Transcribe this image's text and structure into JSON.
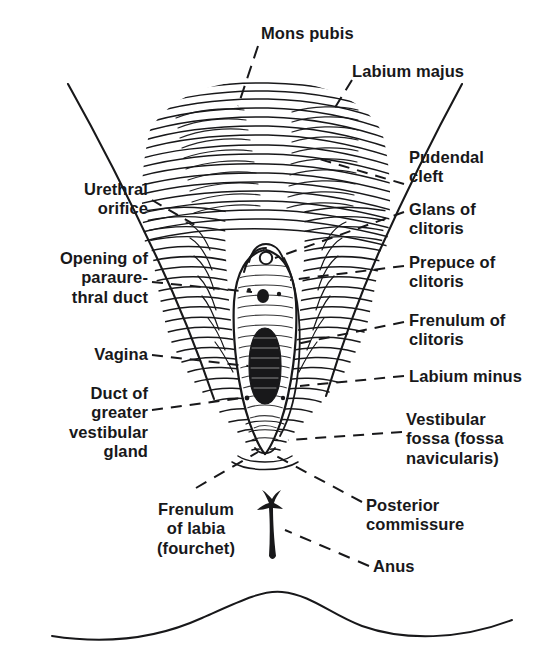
{
  "figure": {
    "ink_color": "#18181a",
    "background_color": "#ffffff",
    "style": "black-and-white engraved line-and-stipple medical illustration with dashed leader lines"
  },
  "labels": {
    "mons_pubis": "Mons pubis",
    "labium_majus": "Labium majus",
    "pudendal_cleft": "Pudendal\ncleft",
    "glans_of_clitoris": "Glans of\nclitoris",
    "prepuce_of_clitoris": "Prepuce of\nclitoris",
    "frenulum_of_clitoris": "Frenulum of\nclitoris",
    "labium_minus": "Labium minus",
    "vestibular_fossa": "Vestibular\nfossa (fossa\nnavicularis)",
    "posterior_commissure": "Posterior\ncommissure",
    "anus": "Anus",
    "urethral_orifice": "Urethral\norifice",
    "opening_of_paraurethral_duct": "Opening of\nparaure-\nthral duct",
    "vagina": "Vagina",
    "duct_of_greater_vestibular_gland": "Duct of\ngreater\nvestibular\ngland",
    "frenulum_of_labia": "Frenulum\nof labia\n(fourchet)"
  },
  "label_layout": [
    {
      "key": "mons_pubis",
      "align": "left",
      "x": 261,
      "y": 24,
      "lines": 1
    },
    {
      "key": "labium_majus",
      "align": "left",
      "x": 352,
      "y": 62,
      "lines": 1
    },
    {
      "key": "pudendal_cleft",
      "align": "left",
      "x": 409,
      "y": 148,
      "lines": 2
    },
    {
      "key": "glans_of_clitoris",
      "align": "left",
      "x": 409,
      "y": 200,
      "lines": 2
    },
    {
      "key": "prepuce_of_clitoris",
      "align": "left",
      "x": 409,
      "y": 253,
      "lines": 2
    },
    {
      "key": "frenulum_of_clitoris",
      "align": "left",
      "x": 409,
      "y": 311,
      "lines": 2
    },
    {
      "key": "labium_minus",
      "align": "left",
      "x": 409,
      "y": 367,
      "lines": 1
    },
    {
      "key": "vestibular_fossa",
      "align": "left",
      "x": 406,
      "y": 410,
      "lines": 3
    },
    {
      "key": "posterior_commissure",
      "align": "left",
      "x": 366,
      "y": 496,
      "lines": 2
    },
    {
      "key": "anus",
      "align": "left",
      "x": 373,
      "y": 557,
      "lines": 1
    },
    {
      "key": "urethral_orifice",
      "align": "right",
      "x": 148,
      "y": 180,
      "lines": 2
    },
    {
      "key": "opening_of_paraurethral_duct",
      "align": "right",
      "x": 148,
      "y": 249,
      "lines": 3
    },
    {
      "key": "vagina",
      "align": "right",
      "x": 148,
      "y": 345,
      "lines": 1
    },
    {
      "key": "duct_of_greater_vestibular_gland",
      "align": "right",
      "x": 148,
      "y": 384,
      "lines": 4
    },
    {
      "key": "frenulum_of_labia",
      "align": "center",
      "x": 196,
      "y": 500,
      "lines": 3
    }
  ],
  "structures": [
    {
      "name": "mons-pubis",
      "note": "rounded hair-hatched eminence at top center"
    },
    {
      "name": "labium-majus-left",
      "note": "large hatched fold left of midline"
    },
    {
      "name": "labium-majus-right",
      "note": "large hatched fold right of midline"
    },
    {
      "name": "pudendal-cleft",
      "note": "midline cleft between labia majora"
    },
    {
      "name": "glans-of-clitoris",
      "note": "small pale circle at top of vestibule"
    },
    {
      "name": "prepuce-of-clitoris",
      "note": "hood over the glans"
    },
    {
      "name": "frenulum-of-clitoris",
      "note": "small fold below glans"
    },
    {
      "name": "labium-minus-left",
      "note": "thin inner fold bounding vestibule on left"
    },
    {
      "name": "labium-minus-right",
      "note": "thin inner fold bounding vestibule on right"
    },
    {
      "name": "vestibule",
      "note": "pale stippled oval between labia minora"
    },
    {
      "name": "urethral-orifice",
      "note": "dark dot in upper vestibule"
    },
    {
      "name": "paraurethral-duct-openings",
      "note": "tiny paired dots flanking urethral orifice"
    },
    {
      "name": "vaginal-orifice",
      "note": "large dark vertically elongated oval in vestibule"
    },
    {
      "name": "greater-vestibular-duct-openings",
      "note": "tiny dots low in vestibule"
    },
    {
      "name": "vestibular-fossa",
      "note": "shallow depression below vaginal orifice"
    },
    {
      "name": "posterior-commissure",
      "note": "junction of labia majora posteriorly"
    },
    {
      "name": "frenulum-of-labia",
      "note": "fourchette, posterior fold"
    },
    {
      "name": "anus",
      "note": "small dark vertical slit below the vulva"
    },
    {
      "name": "thigh-contour-left",
      "note": "long diagonal line descending from upper left"
    },
    {
      "name": "thigh-contour-right",
      "note": "long diagonal line descending from upper right"
    },
    {
      "name": "buttock-contour",
      "note": "wavy horizontal line across the bottom of the plate"
    }
  ]
}
